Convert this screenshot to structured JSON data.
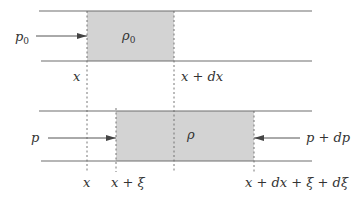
{
  "diagram": {
    "title": "",
    "colors": {
      "line": "#6e6e6e",
      "shade": "#d3d3d3",
      "dash": "#666666",
      "text": "#333333",
      "arrow": "#444444"
    },
    "top_panel": {
      "pressure_label": "p",
      "pressure_sub": "0",
      "density_label": "ρ",
      "density_sub": "0",
      "pos_left": "x",
      "pos_right": "x + dx"
    },
    "bottom_panel": {
      "pressure_left": "p",
      "pressure_right": "p + dp",
      "density_label": "ρ",
      "pos_x": "x",
      "pos_left": "x + ξ",
      "pos_right": "x + dx + ξ + dξ"
    }
  }
}
